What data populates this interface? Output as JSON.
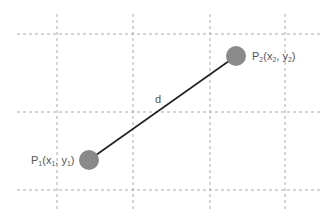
{
  "diagram": {
    "grid": {
      "vertical_x": [
        57,
        133,
        210,
        285
      ],
      "horizontal_y": [
        34,
        112,
        190
      ],
      "color": "#aaaaaa"
    },
    "segment": {
      "label": "d",
      "color": "#222222"
    },
    "points": [
      {
        "name": "P1",
        "cx": 89,
        "cy": 160,
        "label_main": "P",
        "label_sub": "1",
        "label_rest": "(x",
        "label_sub2": "1",
        "label_rest2": ", y",
        "label_sub3": "1",
        "label_end": ")"
      },
      {
        "name": "P2",
        "cx": 236,
        "cy": 56,
        "label_main": "P",
        "label_sub": "2",
        "label_rest": "(x",
        "label_sub2": "2",
        "label_rest2": ", y",
        "label_sub3": "2",
        "label_end": ")"
      }
    ],
    "point_color": "#8a8a8a"
  }
}
